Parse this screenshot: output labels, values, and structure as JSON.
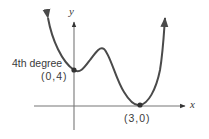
{
  "diagram": {
    "curve_label": "4th degree",
    "axes": {
      "x_label": "x",
      "y_label": "y"
    },
    "points": [
      {
        "label": "(0,4)",
        "x": 0,
        "y": 4
      },
      {
        "label": "(3,0)",
        "x": 3,
        "y": 0
      }
    ],
    "colors": {
      "curve": "#4a4a4a",
      "axis": "#6a6a6a",
      "text": "#3a3a3a"
    }
  }
}
